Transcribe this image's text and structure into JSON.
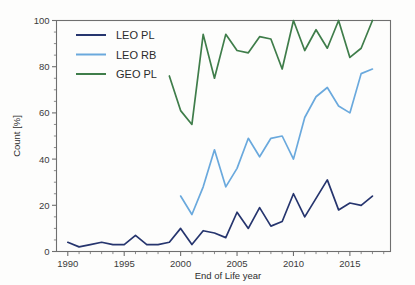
{
  "chart_data": {
    "type": "line",
    "title": "",
    "xlabel": "End of Life year",
    "ylabel": "Count [%]",
    "xlim": [
      1989,
      1018
    ],
    "x_axis_range": [
      1989,
      2018
    ],
    "ylim": [
      0,
      100
    ],
    "grid": false,
    "legend_position": "upper left",
    "x_ticks": [
      "1990",
      "1995",
      "2000",
      "2005",
      "2010",
      "2015"
    ],
    "x_tick_values": [
      1990,
      1995,
      2000,
      2005,
      2010,
      2015
    ],
    "y_ticks": [
      "0",
      "20",
      "40",
      "60",
      "80",
      "100"
    ],
    "y_tick_values": [
      0,
      20,
      40,
      60,
      80,
      100
    ],
    "series": [
      {
        "name": "LEO PL",
        "color": "#26356e",
        "x": [
          1990,
          1991,
          1992,
          1993,
          1994,
          1995,
          1996,
          1997,
          1998,
          1999,
          2000,
          2001,
          2002,
          2003,
          2004,
          2005,
          2006,
          2007,
          2008,
          2009,
          2010,
          2011,
          2012,
          2013,
          2014,
          2015,
          2016,
          2017
        ],
        "values": [
          4,
          2,
          3,
          4,
          3,
          3,
          7,
          3,
          3,
          4,
          10,
          3,
          9,
          8,
          6,
          17,
          10,
          19,
          11,
          13,
          25,
          15,
          23,
          31,
          18,
          21,
          20,
          24
        ]
      },
      {
        "name": "LEO RB",
        "color": "#6aa9dd",
        "x": [
          2000,
          2001,
          2002,
          2003,
          2004,
          2005,
          2006,
          2007,
          2008,
          2009,
          2010,
          2011,
          2012,
          2013,
          2014,
          2015,
          2016,
          2017
        ],
        "values": [
          24,
          16,
          28,
          44,
          28,
          36,
          49,
          41,
          49,
          50,
          40,
          58,
          67,
          71,
          63,
          60,
          77,
          79
        ]
      },
      {
        "name": "GEO PL",
        "color": "#3f7d4a",
        "x": [
          1999,
          2000,
          2001,
          2002,
          2003,
          2004,
          2005,
          2006,
          2007,
          2008,
          2009,
          2010,
          2011,
          2012,
          2013,
          2014,
          2015,
          2016,
          2017
        ],
        "values": [
          76,
          61,
          55,
          94,
          75,
          94,
          87,
          86,
          93,
          92,
          79,
          100,
          87,
          96,
          88,
          100,
          84,
          88,
          100
        ]
      }
    ]
  },
  "legend": {
    "entries": [
      {
        "label": "LEO PL",
        "color": "#26356e"
      },
      {
        "label": "LEO RB",
        "color": "#6aa9dd"
      },
      {
        "label": "GEO PL",
        "color": "#3f7d4a"
      }
    ]
  }
}
